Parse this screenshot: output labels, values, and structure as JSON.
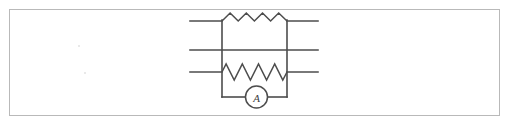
{
  "figure": {
    "kind": "circuit-diagram",
    "frame": {
      "border_color": "#b9b9b9",
      "background": "#ffffff",
      "x": 9,
      "y": 9,
      "width": 491,
      "height": 107
    },
    "ink_color": "#4d4d4d",
    "layout": {
      "left_rail_x": 222,
      "right_rail_x": 287,
      "wire_left_x": 190,
      "wire_right_x": 318,
      "wire_y_top": 21,
      "wire_y_middle": 50,
      "wire_y_bottom": 72,
      "loop_bottom_y": 97
    }
  },
  "components": {
    "resistors": [
      {
        "name": "top-resistor",
        "label": "",
        "peaks": 4,
        "orientation": "horizontal",
        "style": "zigzag-above-line",
        "x_start": 222,
        "x_end": 287,
        "y_baseline": 21,
        "amplitude": 8
      },
      {
        "name": "bottom-resistor",
        "label": "",
        "peaks": 4,
        "orientation": "horizontal",
        "style": "zigzag-centered-on-line",
        "x_start": 222,
        "x_end": 287,
        "y_baseline": 72,
        "amplitude": 8
      }
    ],
    "wires": [
      {
        "name": "top-wire",
        "y": 21,
        "x_start": 190,
        "x_end": 318
      },
      {
        "name": "middle-wire",
        "y": 50,
        "x_start": 190,
        "x_end": 318
      },
      {
        "name": "bottom-wire",
        "y": 72,
        "x_start": 190,
        "x_end": 318
      }
    ],
    "rails": [
      {
        "name": "left-rail",
        "x": 222,
        "y_start": 21,
        "y_end": 97
      },
      {
        "name": "right-rail",
        "x": 287,
        "y_start": 21,
        "y_end": 97
      }
    ],
    "meter": {
      "name": "ammeter",
      "symbol": "A",
      "shape": "circle",
      "center_x": 256.5,
      "center_y": 97,
      "radius": 11
    }
  }
}
